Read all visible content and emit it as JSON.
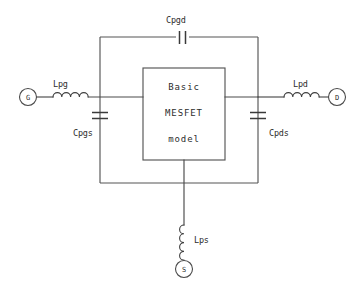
{
  "diagram": {
    "type": "circuit-schematic",
    "line_color": "#4a4a4a",
    "background_color": "#ffffff"
  },
  "model_box": {
    "line1": "Basic",
    "line2": "MESFET",
    "line3": "model"
  },
  "terminals": {
    "gate": "G",
    "drain": "D",
    "source": "S"
  },
  "components": {
    "inductor_gate": "Lpg",
    "inductor_drain": "Lpd",
    "inductor_source": "Lps",
    "capacitor_gate_drain": "Cpgd",
    "capacitor_gate_source": "Cpgs",
    "capacitor_drain_source": "Cpds"
  }
}
